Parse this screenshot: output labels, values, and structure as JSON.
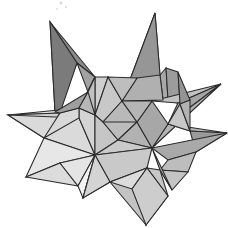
{
  "image": {
    "title": "Stellated polyhedron line render",
    "subject": "stellated-polyhedron",
    "background_color": "#ffffff",
    "stroke_color": "#2b2b2b",
    "stroke_width": 1.05,
    "width": 228,
    "height": 228,
    "rendering": "flat-shaded faceted solid with dark outlines, grayscale",
    "text_labels": []
  },
  "palette": {
    "darkest": "#6f6f6f",
    "dark": "#7e7e7e",
    "mid_dark": "#8c8c8c",
    "mid": "#9c9c9c",
    "mid_light": "#acacac",
    "light": "#bdbdbd",
    "lighter": "#cccccc",
    "pale": "#d8d8d8",
    "palest": "#e4e4e4",
    "near_white": "#efefef",
    "white": "#f8f8f8"
  },
  "spike_tips": [
    {
      "name": "upper-left-spike",
      "x": 50,
      "y": 22
    },
    {
      "name": "upper-right-spike",
      "x": 155,
      "y": 13
    },
    {
      "name": "right-upper-spike",
      "x": 221,
      "y": 84
    },
    {
      "name": "right-lower-spike",
      "x": 227,
      "y": 133
    },
    {
      "name": "left-spike",
      "x": 8,
      "y": 115
    },
    {
      "name": "lower-left-spike",
      "x": 26,
      "y": 177
    },
    {
      "name": "bottom-spike",
      "x": 146,
      "y": 225
    },
    {
      "name": "bottom-left-spike",
      "x": 83,
      "y": 198
    },
    {
      "name": "lower-right-spike",
      "x": 172,
      "y": 190
    }
  ],
  "hubs": [
    {
      "name": "upper-center-hub",
      "x": 108,
      "y": 77
    },
    {
      "name": "center-hub",
      "x": 95,
      "y": 155
    },
    {
      "name": "right-hub",
      "x": 152,
      "y": 148
    },
    {
      "name": "left-hub",
      "x": 79,
      "y": 118
    }
  ],
  "faces": [
    {
      "id": "f01",
      "name": "upper-left-spike-left-face",
      "fill": "#6f6f6f",
      "points": "50,22 55,112 77,63"
    },
    {
      "id": "f02",
      "name": "upper-left-spike-right-face",
      "fill": "#8a8a8a",
      "points": "50,22 77,63 95,77"
    },
    {
      "id": "f03",
      "name": "upper-left-spike-shadow",
      "fill": "#7b7b7b",
      "points": "50,22 55,112 60,113 77,63"
    },
    {
      "id": "f04",
      "name": "upper-left-spike-inner",
      "fill": "#a2a2a2",
      "points": "77,63 95,77 88,92"
    },
    {
      "id": "f05",
      "name": "upper-right-spike-left-face",
      "fill": "#a0a0a0",
      "points": "155,13 122,101 137,78"
    },
    {
      "id": "f06",
      "name": "upper-right-spike-right-face",
      "fill": "#8d8d8d",
      "points": "155,13 137,78 160,75"
    },
    {
      "id": "f07",
      "name": "upper-right-spike-core",
      "fill": "#969696",
      "points": "155,13 160,75 163,100 122,101"
    },
    {
      "id": "f08",
      "name": "mid-right-plate",
      "fill": "#a8a8a8",
      "points": "160,75 166,68 168,100 163,100"
    },
    {
      "id": "f09",
      "name": "right-back-plate",
      "fill": "#9c9c9c",
      "points": "166,68 178,72 180,104 168,100"
    },
    {
      "id": "f10",
      "name": "right-upper-spike-top",
      "fill": "#c2c2c2",
      "points": "221,84 152,101 178,103"
    },
    {
      "id": "f11",
      "name": "right-upper-spike-under",
      "fill": "#a5a5a5",
      "points": "221,84 178,103 168,124"
    },
    {
      "id": "f12",
      "name": "right-wing-upper",
      "fill": "#b4b4b4",
      "points": "221,84 168,124 152,148"
    },
    {
      "id": "f13",
      "name": "right-lower-spike-top",
      "fill": "#b9b9b9",
      "points": "227,133 168,124 190,131"
    },
    {
      "id": "f14",
      "name": "right-lower-spike-under",
      "fill": "#9b9b9b",
      "points": "227,133 190,131 196,152"
    },
    {
      "id": "f15",
      "name": "right-wing-lower",
      "fill": "#a9a9a9",
      "points": "227,133 196,152 168,160 152,148"
    },
    {
      "id": "f16",
      "name": "right-lower-skirt",
      "fill": "#bdbdbd",
      "points": "196,152 188,172 160,170 168,160"
    },
    {
      "id": "f17",
      "name": "lower-right-spike-face",
      "fill": "#c4c4c4",
      "points": "172,190 160,170 188,172"
    },
    {
      "id": "f18",
      "name": "lower-right-spike-side",
      "fill": "#aeaeae",
      "points": "172,190 152,148 160,170"
    },
    {
      "id": "f19",
      "name": "left-spike-top",
      "fill": "#e0e0e0",
      "points": "8,115 79,108 60,113"
    },
    {
      "id": "f20",
      "name": "left-spike-under",
      "fill": "#cfcfcf",
      "points": "8,115 60,113 44,138"
    },
    {
      "id": "f21",
      "name": "left-wing",
      "fill": "#dadada",
      "points": "8,115 44,138 95,155 79,118"
    },
    {
      "id": "f22",
      "name": "left-wing-lower",
      "fill": "#e7e7e7",
      "points": "44,138 26,177 95,155"
    },
    {
      "id": "f23",
      "name": "lower-left-spike-face",
      "fill": "#efefef",
      "points": "26,177 60,163 95,155"
    },
    {
      "id": "f24",
      "name": "lower-left-spike-under",
      "fill": "#dcdcdc",
      "points": "26,177 78,186 60,163"
    },
    {
      "id": "f25",
      "name": "bottom-left-skirt",
      "fill": "#e4e4e4",
      "points": "60,163 78,186 95,155"
    },
    {
      "id": "f26",
      "name": "bottom-left-spike-face",
      "fill": "#f2f2f2",
      "points": "83,198 78,186 95,155"
    },
    {
      "id": "f27",
      "name": "bottom-left-spike-side",
      "fill": "#dedede",
      "points": "83,198 95,155 110,182"
    },
    {
      "id": "f28",
      "name": "center-upper-left-face",
      "fill": "#cfcfcf",
      "points": "95,77 108,77 95,115 79,108"
    },
    {
      "id": "f29",
      "name": "center-upper-mid-face",
      "fill": "#c8c8c8",
      "points": "108,77 122,101 103,122 95,115"
    },
    {
      "id": "f30",
      "name": "center-upper-right-face",
      "fill": "#b9b9b9",
      "points": "122,101 137,122 118,140 103,122"
    },
    {
      "id": "f31",
      "name": "center-left-face",
      "fill": "#d4d4d4",
      "points": "79,108 95,115 95,155 79,118"
    },
    {
      "id": "f32",
      "name": "center-mid-face",
      "fill": "#c6c6c6",
      "points": "95,115 103,122 118,140 95,155"
    },
    {
      "id": "f33",
      "name": "center-right-face",
      "fill": "#bcbcbc",
      "points": "103,122 118,140 137,122"
    },
    {
      "id": "f34",
      "name": "center-right-lower-face",
      "fill": "#b2b2b2",
      "points": "137,122 152,148 118,140"
    },
    {
      "id": "f35",
      "name": "center-lower-face",
      "fill": "#cacaca",
      "points": "95,155 118,140 152,148"
    },
    {
      "id": "f36",
      "name": "bottom-plate-upper",
      "fill": "#c9c9c9",
      "points": "95,155 152,148 147,168 110,182"
    },
    {
      "id": "f37",
      "name": "bottom-plate-left",
      "fill": "#d4d4d4",
      "points": "95,155 110,182 83,198"
    },
    {
      "id": "f38",
      "name": "bottom-spike-left-face",
      "fill": "#c3c3c3",
      "points": "146,225 110,182 147,168"
    },
    {
      "id": "f39",
      "name": "bottom-spike-right-face",
      "fill": "#b6b6b6",
      "points": "146,225 147,168 168,196"
    },
    {
      "id": "f40",
      "name": "bottom-right-skirt",
      "fill": "#c7c7c7",
      "points": "147,168 160,170 168,196"
    },
    {
      "id": "f41",
      "name": "bottom-notch-face",
      "fill": "#dcdcdc",
      "points": "110,182 147,168 132,189"
    },
    {
      "id": "f42",
      "name": "upper-right-back-wing",
      "fill": "#b0b0b0",
      "points": "137,78 160,75 163,100 122,101"
    },
    {
      "id": "f43",
      "name": "upper-center-ridge",
      "fill": "#bebebe",
      "points": "108,77 122,101 137,78"
    },
    {
      "id": "f44",
      "name": "right-center-wedge",
      "fill": "#a7a7a7",
      "points": "137,122 152,101 168,124 152,148"
    },
    {
      "id": "f45",
      "name": "right-center-upper-wedge",
      "fill": "#b5b5b5",
      "points": "122,101 152,101 137,122"
    },
    {
      "id": "f46",
      "name": "mid-left-wedge",
      "fill": "#d9d9d9",
      "points": "60,113 79,108 79,118 44,138"
    },
    {
      "id": "f47",
      "name": "inner-left-dark-wedge",
      "fill": "#9f9f9f",
      "points": "55,112 60,113 79,108 88,92"
    },
    {
      "id": "f48",
      "name": "inner-left-top-wedge",
      "fill": "#b7b7b7",
      "points": "88,92 79,108 95,115 95,77"
    },
    {
      "id": "f49",
      "name": "center-left-joint",
      "fill": "#c0c0c0",
      "points": "88,92 95,77 95,115"
    },
    {
      "id": "f50",
      "name": "right-back-small-face",
      "fill": "#949494",
      "points": "178,72 180,104 190,100"
    },
    {
      "id": "f51",
      "name": "right-mid-notch",
      "fill": "#c8c8c8",
      "points": "168,124 190,131 180,104"
    },
    {
      "id": "f52",
      "name": "right-skirt-fold",
      "fill": "#b3b3b3",
      "points": "180,104 190,131 190,100"
    },
    {
      "id": "f53",
      "name": "lower-center-notch",
      "fill": "#cdcdcd",
      "points": "132,189 147,168 168,196 146,225"
    }
  ],
  "specks": [
    {
      "name": "scan-speck-a",
      "x": 61,
      "y": 3,
      "r": 1.6
    },
    {
      "name": "scan-speck-b",
      "x": 66,
      "y": 7,
      "r": 1.1
    },
    {
      "name": "scan-speck-c",
      "x": 57,
      "y": 9,
      "r": 0.9
    }
  ]
}
